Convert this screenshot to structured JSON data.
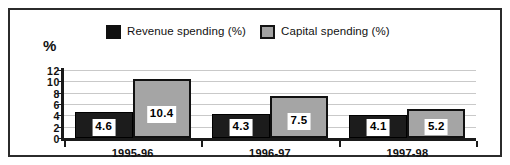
{
  "chart_data": {
    "type": "bar",
    "title": "",
    "subtitle": "",
    "xlabel": "",
    "ylabel": "%",
    "ylim": [
      0,
      12
    ],
    "yticks": [
      0,
      2,
      4,
      6,
      8,
      10,
      12
    ],
    "grid": true,
    "legend_position": "top",
    "categories": [
      "1995-96",
      "1996-97",
      "1997-98"
    ],
    "series": [
      {
        "name": "Revenue spending (%)",
        "color": "#1c1c1c",
        "values": [
          4.6,
          4.3,
          4.1
        ],
        "labels": [
          "4.6",
          "4.3",
          "4.1"
        ]
      },
      {
        "name": "Capital spending (%)",
        "color": "#a5a5a5",
        "values": [
          10.4,
          7.5,
          5.2
        ],
        "labels": [
          "10.4",
          "7.5",
          "5.2"
        ]
      }
    ]
  },
  "axis": {
    "y_title": "%",
    "tick_labels": [
      "12",
      "10",
      "8",
      "6",
      "4",
      "2",
      "0"
    ]
  },
  "legend": {
    "items": [
      {
        "label": "Revenue spending (%)",
        "swatch": "black-square-icon"
      },
      {
        "label": "Capital spending (%)",
        "swatch": "gray-square-icon"
      }
    ]
  },
  "colors": {
    "revenue": "#1c1c1c",
    "capital": "#a5a5a5",
    "gridline": "#c9c9c9",
    "axis": "#1a1a1a",
    "frame": "#2b2b2b",
    "background": "#ffffff"
  }
}
